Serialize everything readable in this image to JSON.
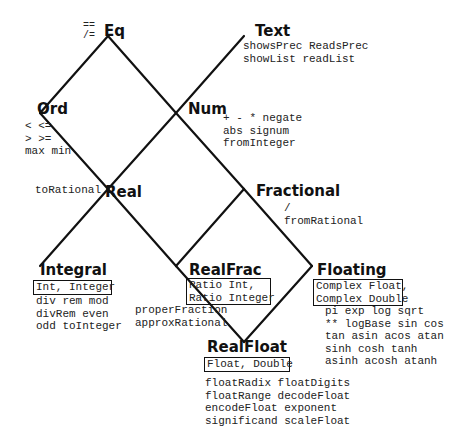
{
  "diagram": {
    "line_color": "#111111",
    "nodes": {
      "eq": {
        "label": "Eq",
        "ops": [
          "==",
          "/="
        ]
      },
      "text": {
        "label": "Text",
        "ops": [
          "showsPrec ReadsPrec",
          "showList readList"
        ]
      },
      "ord": {
        "label": "Ord",
        "ops": [
          "< <=",
          "> >=",
          "max min"
        ]
      },
      "num": {
        "label": "Num",
        "ops": [
          "+ - * negate",
          "abs signum",
          "fromInteger"
        ]
      },
      "real": {
        "label": "Real",
        "ops": [
          "toRational"
        ]
      },
      "fractional": {
        "label": "Fractional",
        "ops": [
          "/",
          "fromRational"
        ]
      },
      "integral": {
        "label": "Integral",
        "instances": [
          "Int, Integer"
        ],
        "ops": [
          "div rem mod",
          "divRem even",
          "odd toInteger"
        ]
      },
      "realfrac": {
        "label": "RealFrac",
        "instances": [
          "Ratio Int,",
          "Ratio Integer"
        ],
        "ops": [
          "properFraction",
          "approxRational"
        ]
      },
      "floating": {
        "label": "Floating",
        "instances": [
          "Complex Float,",
          "Complex Double"
        ],
        "ops": [
          "pi exp log sqrt",
          "** logBase sin cos",
          "tan asin acos atan",
          "sinh cosh tanh",
          "asinh acosh atanh"
        ]
      },
      "realfloat": {
        "label": "RealFloat",
        "instances": [
          "Float, Double"
        ],
        "ops": [
          "floatRadix floatDigits",
          "floatRange decodeFloat",
          "encodeFloat exponent",
          "significand scaleFloat"
        ]
      }
    },
    "edges": [
      [
        "Eq",
        "Ord"
      ],
      [
        "Eq",
        "Num"
      ],
      [
        "Text",
        "Num"
      ],
      [
        "Ord",
        "Real"
      ],
      [
        "Num",
        "Real"
      ],
      [
        "Num",
        "Fractional"
      ],
      [
        "Real",
        "Integral"
      ],
      [
        "Real",
        "RealFrac"
      ],
      [
        "Fractional",
        "RealFrac"
      ],
      [
        "Fractional",
        "Floating"
      ],
      [
        "RealFrac",
        "RealFloat"
      ],
      [
        "Floating",
        "RealFloat"
      ]
    ]
  }
}
